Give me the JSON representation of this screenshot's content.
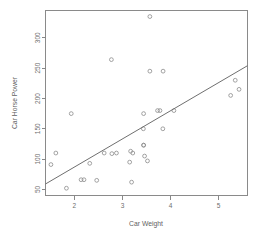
{
  "chart_data": {
    "type": "scatter",
    "title": "",
    "xlabel": "Car Weight",
    "ylabel": "Car Horse Power",
    "xlim": [
      1.4,
      5.6
    ],
    "ylim": [
      40,
      345
    ],
    "grid": false,
    "legend": null,
    "xticks": [
      2,
      3,
      4,
      5
    ],
    "xtick_labels": [
      "2",
      "3",
      "4",
      "5"
    ],
    "yticks": [
      50,
      100,
      150,
      200,
      250,
      300
    ],
    "ytick_labels": [
      "50",
      "100",
      "150",
      "200",
      "250",
      "300"
    ],
    "series": [
      {
        "name": "cars",
        "marker": "open-circle",
        "color": "#8b8b8b",
        "x": [
          2.62,
          2.875,
          2.32,
          3.215,
          3.44,
          3.46,
          3.57,
          3.19,
          3.15,
          3.44,
          3.44,
          4.07,
          3.73,
          3.78,
          5.25,
          5.424,
          5.345,
          2.2,
          1.615,
          1.835,
          2.465,
          3.52,
          3.435,
          3.84,
          3.845,
          1.935,
          2.14,
          1.513,
          3.17,
          2.77,
          3.57,
          2.78
        ],
        "y": [
          110,
          110,
          93,
          110,
          175,
          105,
          245,
          62,
          95,
          123,
          123,
          180,
          180,
          180,
          205,
          215,
          230,
          66,
          110,
          52,
          65,
          97,
          150,
          150,
          245,
          175,
          66,
          91,
          113,
          264,
          335,
          109
        ]
      }
    ],
    "fit_line": {
      "name": "linear-regression",
      "color": "#6f6f6f",
      "x_start": 1.4,
      "y_start": 59,
      "x_end": 5.6,
      "y_end": 254,
      "slope": 46.4,
      "intercept": -6.0
    }
  },
  "axis": {
    "x_title": "Car Weight",
    "y_title": "Car Horse Power"
  }
}
